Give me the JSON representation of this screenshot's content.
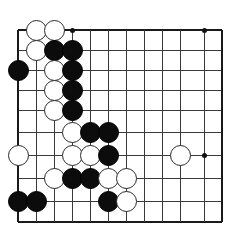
{
  "app": {
    "title": "Go Board Position",
    "type": "goban-diagram"
  },
  "board": {
    "label": "go-board",
    "columns": 12,
    "rows": 10,
    "origin_x": 18,
    "origin_y": 30,
    "spacing_x": 18,
    "spacing_y": 21,
    "x_positions": [
      18,
      36,
      54,
      72,
      90,
      108,
      126,
      144,
      162,
      180,
      204,
      222
    ],
    "y_positions": [
      30,
      50,
      70,
      90,
      110,
      132,
      155,
      178,
      201,
      222
    ],
    "line_color": "#3a3a3a",
    "edge_color": "#1a1a1a",
    "background_color": "#ffffff",
    "black_color": "#0c0c0c",
    "white_color": "#ffffff",
    "white_outline_color": "#2a2a2a"
  },
  "star_points": [
    {
      "name": "star-point-top-left",
      "col": 3,
      "row": 0
    },
    {
      "name": "star-point-top-right",
      "col": 10,
      "row": 0
    },
    {
      "name": "star-point-middle-right",
      "col": 10,
      "row": 6
    }
  ],
  "stones": [
    {
      "name": "stone-white-c1-r0",
      "color": "white",
      "col": 1,
      "row": 0
    },
    {
      "name": "stone-white-c2-r0",
      "color": "white",
      "col": 2,
      "row": 0
    },
    {
      "name": "stone-white-c1-r1",
      "color": "white",
      "col": 1,
      "row": 1
    },
    {
      "name": "stone-black-c2-r1",
      "color": "black",
      "col": 2,
      "row": 1
    },
    {
      "name": "stone-black-c3-r1",
      "color": "black",
      "col": 3,
      "row": 1
    },
    {
      "name": "stone-black-c0-r2",
      "color": "black",
      "col": 0,
      "row": 2
    },
    {
      "name": "stone-white-c2-r2",
      "color": "white",
      "col": 2,
      "row": 2
    },
    {
      "name": "stone-black-c3-r2",
      "color": "black",
      "col": 3,
      "row": 2
    },
    {
      "name": "stone-white-c2-r3",
      "color": "white",
      "col": 2,
      "row": 3
    },
    {
      "name": "stone-black-c3-r3",
      "color": "black",
      "col": 3,
      "row": 3
    },
    {
      "name": "stone-white-c2-r4",
      "color": "white",
      "col": 2,
      "row": 4
    },
    {
      "name": "stone-black-c3-r4",
      "color": "black",
      "col": 3,
      "row": 4
    },
    {
      "name": "stone-white-c3-r5",
      "color": "white",
      "col": 3,
      "row": 5
    },
    {
      "name": "stone-black-c4-r5",
      "color": "black",
      "col": 4,
      "row": 5
    },
    {
      "name": "stone-black-c5-r5",
      "color": "black",
      "col": 5,
      "row": 5
    },
    {
      "name": "stone-white-c0-r6",
      "color": "white",
      "col": 0,
      "row": 6
    },
    {
      "name": "stone-white-c3-r6",
      "color": "white",
      "col": 3,
      "row": 6
    },
    {
      "name": "stone-white-c4-r6",
      "color": "white",
      "col": 4,
      "row": 6
    },
    {
      "name": "stone-black-c5-r6",
      "color": "black",
      "col": 5,
      "row": 6
    },
    {
      "name": "stone-white-c9-r6",
      "color": "white",
      "col": 9,
      "row": 6
    },
    {
      "name": "stone-white-c2-r7",
      "color": "white",
      "col": 2,
      "row": 7
    },
    {
      "name": "stone-black-c3-r7",
      "color": "black",
      "col": 3,
      "row": 7
    },
    {
      "name": "stone-black-c4-r7",
      "color": "black",
      "col": 4,
      "row": 7
    },
    {
      "name": "stone-white-c5-r7",
      "color": "white",
      "col": 5,
      "row": 7
    },
    {
      "name": "stone-white-c6-r7",
      "color": "white",
      "col": 6,
      "row": 7
    },
    {
      "name": "stone-black-c0-r8",
      "color": "black",
      "col": 0,
      "row": 8
    },
    {
      "name": "stone-black-c1-r8",
      "color": "black",
      "col": 1,
      "row": 8
    },
    {
      "name": "stone-black-c5-r8",
      "color": "black",
      "col": 5,
      "row": 8
    },
    {
      "name": "stone-white-c6-r8",
      "color": "white",
      "col": 6,
      "row": 8
    }
  ]
}
